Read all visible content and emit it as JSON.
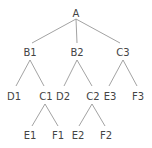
{
  "diagram": {
    "type": "tree",
    "nodes": [
      {
        "id": "A",
        "label": "A",
        "x": 76,
        "y": 13
      },
      {
        "id": "B1",
        "label": "B1",
        "x": 30,
        "y": 52
      },
      {
        "id": "B2",
        "label": "B2",
        "x": 77,
        "y": 52
      },
      {
        "id": "C3",
        "label": "C3",
        "x": 123,
        "y": 52
      },
      {
        "id": "D1",
        "label": "D1",
        "x": 14,
        "y": 96
      },
      {
        "id": "C1",
        "label": "C1",
        "x": 46,
        "y": 96
      },
      {
        "id": "D2",
        "label": "D2",
        "x": 63,
        "y": 96
      },
      {
        "id": "C2",
        "label": "C2",
        "x": 93,
        "y": 96
      },
      {
        "id": "E3",
        "label": "E3",
        "x": 110,
        "y": 96
      },
      {
        "id": "F3",
        "label": "F3",
        "x": 138,
        "y": 96
      },
      {
        "id": "E1",
        "label": "E1",
        "x": 30,
        "y": 135
      },
      {
        "id": "F1",
        "label": "F1",
        "x": 58,
        "y": 135
      },
      {
        "id": "E2",
        "label": "E2",
        "x": 78,
        "y": 135
      },
      {
        "id": "F2",
        "label": "F2",
        "x": 106,
        "y": 135
      }
    ],
    "edges": [
      {
        "from": "A",
        "to": "B1",
        "x1": 76,
        "y1": 19,
        "x2": 32,
        "y2": 43
      },
      {
        "from": "A",
        "to": "B2",
        "x1": 76,
        "y1": 19,
        "x2": 77,
        "y2": 43
      },
      {
        "from": "A",
        "to": "C3",
        "x1": 76,
        "y1": 19,
        "x2": 120,
        "y2": 43
      },
      {
        "from": "B1",
        "to": "D1",
        "x1": 30,
        "y1": 60,
        "x2": 16,
        "y2": 86
      },
      {
        "from": "B1",
        "to": "C1",
        "x1": 30,
        "y1": 60,
        "x2": 44,
        "y2": 86
      },
      {
        "from": "B2",
        "to": "D2",
        "x1": 77,
        "y1": 60,
        "x2": 64,
        "y2": 86
      },
      {
        "from": "B2",
        "to": "C2",
        "x1": 77,
        "y1": 60,
        "x2": 92,
        "y2": 86
      },
      {
        "from": "C3",
        "to": "E3",
        "x1": 123,
        "y1": 60,
        "x2": 109,
        "y2": 86
      },
      {
        "from": "C3",
        "to": "F3",
        "x1": 123,
        "y1": 60,
        "x2": 137,
        "y2": 86
      },
      {
        "from": "C1",
        "to": "E1",
        "x1": 45,
        "y1": 104,
        "x2": 32,
        "y2": 126
      },
      {
        "from": "C1",
        "to": "F1",
        "x1": 45,
        "y1": 104,
        "x2": 58,
        "y2": 126
      },
      {
        "from": "C2",
        "to": "E2",
        "x1": 92,
        "y1": 104,
        "x2": 79,
        "y2": 126
      },
      {
        "from": "C2",
        "to": "F2",
        "x1": 92,
        "y1": 104,
        "x2": 105,
        "y2": 126
      }
    ]
  }
}
